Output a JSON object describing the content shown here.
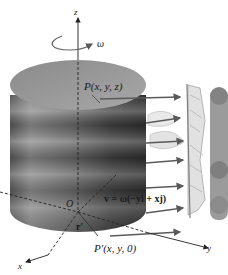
{
  "figure": {
    "axes": {
      "z": "z",
      "x": "x",
      "y": "y"
    },
    "angular_velocity_label": "ω",
    "origin_label": "O",
    "point_label": "P(x, y, z)",
    "projection_label": "P′(x, y, 0)",
    "position_vector_label": "r′",
    "velocity_formula": "v = ω(−yi + xj)",
    "colors": {
      "background": "#ffffff",
      "cylinder_top": "#9a9a9a",
      "cylinder_side_dark": "#3a3a3a",
      "cylinder_side_light": "#b5b5b5",
      "arrow": "#5a5a5a",
      "axis": "#222222",
      "sketch": "#8a8a8a"
    }
  }
}
